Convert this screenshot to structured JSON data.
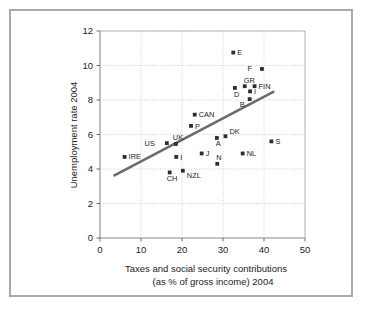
{
  "chart_data": {
    "type": "scatter",
    "title": "",
    "xlabel": "Taxes and social security contributions (as % of gross income) 2004",
    "xlabel_line1": "Taxes and social security contributions",
    "xlabel_line2": "(as % of gross income) 2004",
    "ylabel": "Unemployment rate 2004",
    "xlim": [
      0,
      50
    ],
    "ylim": [
      0,
      12
    ],
    "xticks": [
      0,
      10,
      20,
      30,
      40,
      50
    ],
    "yticks": [
      0,
      2,
      4,
      6,
      8,
      10,
      12
    ],
    "grid": true,
    "legend": "none",
    "marker_color": "#2d2d2d",
    "trendline_color": "#6b6b6b",
    "points": [
      {
        "label": "IRE",
        "x": 6.0,
        "y": 4.7,
        "label_dx": 4,
        "label_dy": 2.5
      },
      {
        "label": "US",
        "x": 16.3,
        "y": 5.5,
        "label_dx": -12,
        "label_dy": 2.5
      },
      {
        "label": "UK",
        "x": 18.5,
        "y": 5.45,
        "label_dx": -3,
        "label_dy": -4
      },
      {
        "label": "CH",
        "x": 17.0,
        "y": 3.8,
        "label_dx": -3,
        "label_dy": 9
      },
      {
        "label": "NZL",
        "x": 20.2,
        "y": 3.9,
        "label_dx": 4,
        "label_dy": 7
      },
      {
        "label": "P",
        "x": 22.2,
        "y": 6.5,
        "label_dx": 4,
        "label_dy": 3
      },
      {
        "label": "CAN",
        "x": 23.1,
        "y": 7.15,
        "label_dx": 4,
        "label_dy": 2.5
      },
      {
        "label": "I",
        "x": 18.6,
        "y": 4.7,
        "label_dx": 4,
        "label_dy": 3
      },
      {
        "label": "J",
        "x": 24.8,
        "y": 4.9,
        "label_dx": 4,
        "label_dy": 3
      },
      {
        "label": "A",
        "x": 28.5,
        "y": 5.8,
        "label_dx": -1,
        "label_dy": 8
      },
      {
        "label": "N",
        "x": 28.6,
        "y": 4.3,
        "label_dx": -1,
        "label_dy": -4
      },
      {
        "label": "DK",
        "x": 30.6,
        "y": 5.9,
        "label_dx": 4,
        "label_dy": -2
      },
      {
        "label": "NL",
        "x": 34.8,
        "y": 4.9,
        "label_dx": 4,
        "label_dy": 3
      },
      {
        "label": "S",
        "x": 41.8,
        "y": 5.6,
        "label_dx": 4,
        "label_dy": 3
      },
      {
        "label": "E",
        "x": 32.5,
        "y": 10.75,
        "label_dx": 4,
        "label_dy": 2.5
      },
      {
        "label": "F",
        "x": 39.5,
        "y": 9.8,
        "label_dx": -10,
        "label_dy": 2.5
      },
      {
        "label": "D",
        "x": 32.9,
        "y": 8.7,
        "label_dx": -1,
        "label_dy": 9
      },
      {
        "label": "GR",
        "x": 35.3,
        "y": 8.8,
        "label_dx": -1,
        "label_dy": -3
      },
      {
        "label": "FIN",
        "x": 37.7,
        "y": 8.8,
        "label_dx": 4,
        "label_dy": 2.5
      },
      {
        "label": "I2",
        "x": 36.6,
        "y": 8.5,
        "label_text": "I",
        "label_dx": 4,
        "label_dy": 3
      },
      {
        "label": "B",
        "x": 36.5,
        "y": 8.05,
        "label_dx": -5,
        "label_dy": 8
      }
    ],
    "trendline": {
      "x0": 3.3,
      "y0": 3.6,
      "x1": 42.5,
      "y1": 8.5
    }
  }
}
